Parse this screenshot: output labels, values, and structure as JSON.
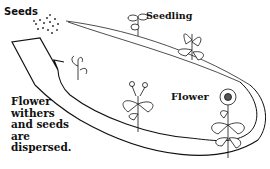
{
  "diagram": {
    "type": "plant life cycle",
    "labels": {
      "seeds": "Seeds",
      "seedling": "Seedling",
      "flower": "Flower",
      "withers_lines": [
        "Flower",
        "withers",
        "and seeds",
        "are",
        "dispersed."
      ]
    },
    "stages": [
      "seeds",
      "seedling",
      "young plant",
      "flowering plant",
      "flower",
      "withered flower"
    ],
    "colors": {
      "line": "#111111",
      "background": "#ffffff"
    }
  }
}
